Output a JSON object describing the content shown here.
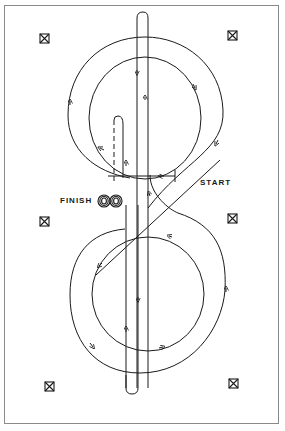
{
  "diagram": {
    "type": "figure-eight riding pattern with center lane",
    "labels": {
      "start": "START",
      "finish": "FINISH"
    },
    "colors": {
      "line": "#1a1a1a",
      "frame": "#8a8a8a",
      "background": "#ffffff"
    },
    "markers": [
      {
        "name": "top-left-marker",
        "x": 44,
        "y": 39
      },
      {
        "name": "top-right-marker",
        "x": 232,
        "y": 36
      },
      {
        "name": "middle-left-marker",
        "x": 44,
        "y": 221
      },
      {
        "name": "middle-right-marker",
        "x": 232,
        "y": 218
      },
      {
        "name": "bottom-left-marker",
        "x": 49,
        "y": 387
      },
      {
        "name": "bottom-right-marker",
        "x": 233,
        "y": 384
      }
    ],
    "elements": {
      "center_lane": "vertical lane with rounded ends through both loops",
      "upper_loop": "outer and inner circles, clockwise inner with arrows",
      "lower_loop": "outer and inner circles",
      "finish_icon": "concentric figure-eight (cones) symbol",
      "start_gate": "horizontal line with end bar",
      "dashed_path": "dashed return path to finish"
    }
  }
}
